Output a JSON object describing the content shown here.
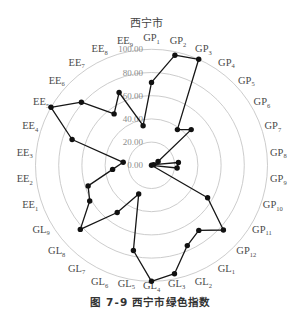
{
  "figure": {
    "caption_number": "图 7-9",
    "caption_text": "西宁市绿色指数"
  },
  "chart_data": {
    "type": "line",
    "coordinate_system": "polar",
    "chart_style": "radar",
    "title": "西宁市",
    "xlabel": "",
    "ylabel": "",
    "direction": "clockwise",
    "start_axis": "top",
    "categories": [
      {
        "prefix": "GP",
        "sub": "1"
      },
      {
        "prefix": "GP",
        "sub": "2"
      },
      {
        "prefix": "GP",
        "sub": "3"
      },
      {
        "prefix": "GP",
        "sub": "4"
      },
      {
        "prefix": "GP",
        "sub": "5"
      },
      {
        "prefix": "GP",
        "sub": "6"
      },
      {
        "prefix": "GP",
        "sub": "7"
      },
      {
        "prefix": "GP",
        "sub": "8"
      },
      {
        "prefix": "GP",
        "sub": "9"
      },
      {
        "prefix": "GP",
        "sub": "10"
      },
      {
        "prefix": "GP",
        "sub": "11"
      },
      {
        "prefix": "GP",
        "sub": "12"
      },
      {
        "prefix": "GL",
        "sub": "1"
      },
      {
        "prefix": "GL",
        "sub": "2"
      },
      {
        "prefix": "GL",
        "sub": "3"
      },
      {
        "prefix": "GL",
        "sub": "4"
      },
      {
        "prefix": "GL",
        "sub": "5"
      },
      {
        "prefix": "GL",
        "sub": "6"
      },
      {
        "prefix": "GL",
        "sub": "7"
      },
      {
        "prefix": "GL",
        "sub": "8"
      },
      {
        "prefix": "GL",
        "sub": "9"
      },
      {
        "prefix": "EE",
        "sub": "1"
      },
      {
        "prefix": "EE",
        "sub": "2"
      },
      {
        "prefix": "EE",
        "sub": "3"
      },
      {
        "prefix": "EE",
        "sub": "4"
      },
      {
        "prefix": "EE",
        "sub": "5"
      },
      {
        "prefix": "EE",
        "sub": "6"
      },
      {
        "prefix": "EE",
        "sub": "7"
      },
      {
        "prefix": "EE",
        "sub": "8"
      },
      {
        "prefix": "EE",
        "sub": "9"
      }
    ],
    "series": [
      {
        "name": "西宁市",
        "values": [
          71.5,
          97.0,
          100.0,
          38.0,
          46.0,
          6.6,
          2.0,
          23.3,
          22.2,
          0.0,
          55.8,
          83.4,
          69.4,
          75.8,
          95.5,
          100.0,
          75.1,
          27.1,
          50.3,
          82.6,
          61.5,
          57.5,
          33.7,
          24.5,
          72.0,
          100.0,
          81.3,
          54.8,
          68.7,
          34.9
        ]
      }
    ],
    "rlim": [
      0,
      100
    ],
    "rticks": [
      0,
      20,
      40,
      60,
      80,
      100
    ],
    "rtick_labels": [
      "0.00",
      "20.00",
      "40.00",
      "60.00",
      "80.00",
      "100.00"
    ],
    "grid": true,
    "legend": "none",
    "colors": {
      "series": "#161616",
      "grid": "#c6c6c6"
    }
  }
}
